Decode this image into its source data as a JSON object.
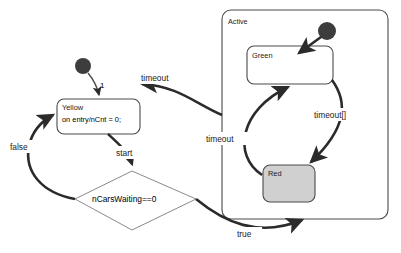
{
  "diagram": {
    "type": "uml-statechart",
    "title": "",
    "background_color": "#ffffff",
    "stroke_color": "#3a3a3a",
    "thick_stroke_color": "#2b2b2b",
    "fill_white": "#ffffff",
    "fill_gray": "#d0d0d0",
    "initial_node_color": "#3d3d3d"
  },
  "states": {
    "yellow": {
      "name": "Yellow",
      "entry_action": "on entry/nCnt  = 0;",
      "fill": "#ffffff"
    },
    "active": {
      "name": "Active",
      "fill": "#ffffff"
    },
    "green": {
      "name": "Green",
      "fill": "#ffffff"
    },
    "red": {
      "name": "Red",
      "fill": "#d0d0d0"
    }
  },
  "decision": {
    "guard": "nCarsWaiting==0",
    "branch_true": "true",
    "branch_false": "false"
  },
  "transitions": {
    "initial_to_yellow": "1",
    "active_to_yellow": "timeout",
    "red_to_green": "timeout",
    "green_to_red": "timeout[]",
    "yellow_to_decision": "start",
    "decision_false_to_yellow": "false",
    "decision_true_to_active": "true"
  },
  "pseudostates": {
    "top_initial": "initial-state",
    "active_initial": "initial-state"
  }
}
